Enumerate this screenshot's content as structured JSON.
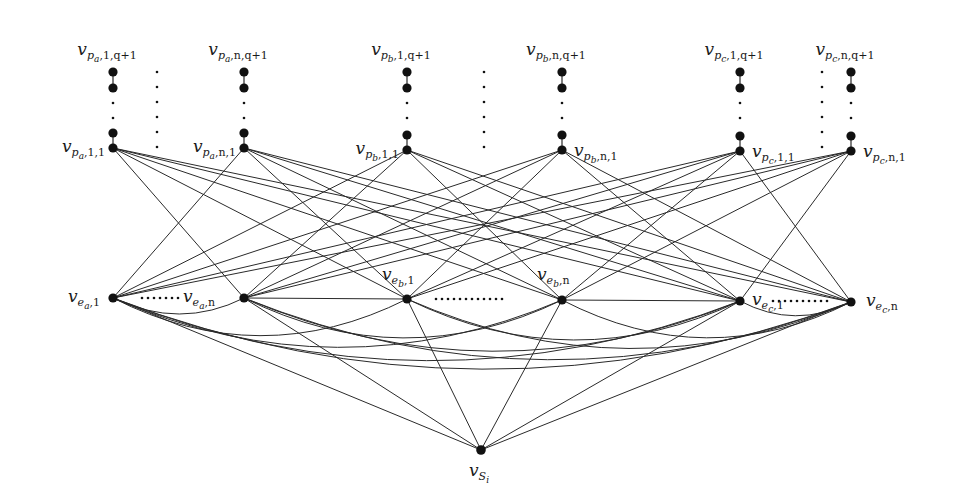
{
  "columns": [
    {
      "id": "pa1",
      "x": 113,
      "top_label": {
        "base": "v",
        "sub": "p",
        "subsub": "a",
        "tail": ",1,q+1"
      },
      "bottom_label": {
        "base": "v",
        "sub": "p",
        "subsub": "a",
        "tail": ",1,1"
      },
      "bottom_label_side": "left"
    },
    {
      "id": "pan",
      "x": 244,
      "top_label": {
        "base": "v",
        "sub": "p",
        "subsub": "a",
        "tail": ",n,q+1"
      },
      "bottom_label": {
        "base": "v",
        "sub": "p",
        "subsub": "a",
        "tail": ",n,1"
      },
      "bottom_label_side": "left"
    },
    {
      "id": "pb1",
      "x": 407,
      "top_label": {
        "base": "v",
        "sub": "p",
        "subsub": "b",
        "tail": ",1,q+1"
      },
      "bottom_label": {
        "base": "v",
        "sub": "p",
        "subsub": "b",
        "tail": ",1,1"
      },
      "bottom_label_side": "left"
    },
    {
      "id": "pbn",
      "x": 562,
      "top_label": {
        "base": "v",
        "sub": "p",
        "subsub": "b",
        "tail": ",n,q+1"
      },
      "bottom_label": {
        "base": "v",
        "sub": "p",
        "subsub": "b",
        "tail": ",n,1"
      },
      "bottom_label_side": "right"
    },
    {
      "id": "pc1",
      "x": 740,
      "top_label": {
        "base": "v",
        "sub": "p",
        "subsub": "c",
        "tail": ",1,q+1"
      },
      "bottom_label": {
        "base": "v",
        "sub": "p",
        "subsub": "c",
        "tail": ",1,1"
      },
      "bottom_label_side": "right"
    },
    {
      "id": "pcn",
      "x": 851,
      "top_label": {
        "base": "v",
        "sub": "p",
        "subsub": "c",
        "tail": ",n,q+1"
      },
      "bottom_label": {
        "base": "v",
        "sub": "p",
        "subsub": "c",
        "tail": ",n,1"
      },
      "bottom_label_side": "right"
    }
  ],
  "e_nodes": [
    {
      "id": "ea1",
      "x": 113,
      "y": 298,
      "label": {
        "base": "v",
        "sub": "e",
        "subsub": "a",
        "tail": ",1"
      }
    },
    {
      "id": "ean",
      "x": 244,
      "y": 298,
      "label": {
        "base": "v",
        "sub": "e",
        "subsub": "a",
        "tail": ",n"
      }
    },
    {
      "id": "eb1",
      "x": 407,
      "y": 299,
      "label": {
        "base": "v",
        "sub": "e",
        "subsub": "b",
        "tail": ",1"
      }
    },
    {
      "id": "ebn",
      "x": 562,
      "y": 300,
      "label": {
        "base": "v",
        "sub": "e",
        "subsub": "b",
        "tail": ",n"
      }
    },
    {
      "id": "ec1",
      "x": 740,
      "y": 301,
      "label": {
        "base": "v",
        "sub": "e",
        "subsub": "c",
        "tail": ",1"
      }
    },
    {
      "id": "ecn",
      "x": 851,
      "y": 302,
      "label": {
        "base": "v",
        "sub": "e",
        "subsub": "c",
        "tail": ",n"
      }
    }
  ],
  "source_node": {
    "id": "s",
    "x": 481,
    "y": 450,
    "label": {
      "base": "v",
      "sub": "S",
      "subsub": "i"
    }
  },
  "ellipsis": "......",
  "colors": {
    "node": "#111111",
    "edge": "#2a2a2a",
    "text": "#1a1a1a",
    "background": "#ffffff"
  }
}
